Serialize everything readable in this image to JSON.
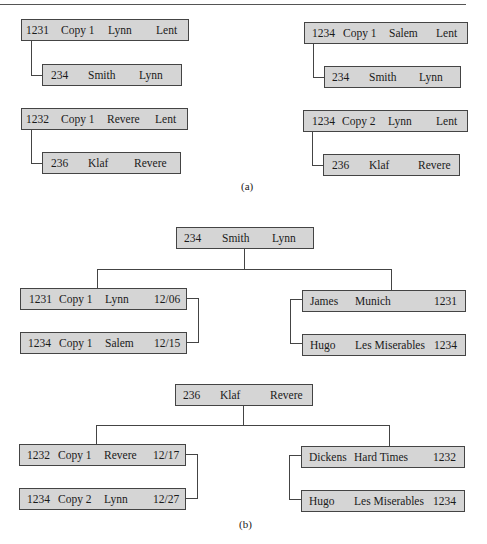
{
  "figure": {
    "part_a": {
      "caption": "(a)",
      "groups": [
        {
          "parent": [
            "1231",
            "Copy 1",
            "Lynn",
            "Lent"
          ],
          "child": [
            "234",
            "Smith",
            "Lynn"
          ]
        },
        {
          "parent": [
            "1232",
            "Copy 1",
            "Revere",
            "Lent"
          ],
          "child": [
            "236",
            "Klaf",
            "Revere"
          ]
        },
        {
          "parent": [
            "1234",
            "Copy 1",
            "Salem",
            "Lent"
          ],
          "child": [
            "234",
            "Smith",
            "Lynn"
          ]
        },
        {
          "parent": [
            "1234",
            "Copy 2",
            "Lynn",
            "Lent"
          ],
          "child": [
            "236",
            "Klaf",
            "Revere"
          ]
        }
      ]
    },
    "part_b": {
      "caption": "(b)",
      "trees": [
        {
          "root": [
            "234",
            "Smith",
            "Lynn"
          ],
          "left": [
            [
              "1231",
              "Copy 1",
              "Lynn",
              "12/06"
            ],
            [
              "1234",
              "Copy 1",
              "Salem",
              "12/15"
            ]
          ],
          "right": [
            [
              "James",
              "Munich",
              "1231"
            ],
            [
              "Hugo",
              "Les Miserables",
              "1234"
            ]
          ]
        },
        {
          "root": [
            "236",
            "Klaf",
            "Revere"
          ],
          "left": [
            [
              "1232",
              "Copy 1",
              "Revere",
              "12/17"
            ],
            [
              "1234",
              "Copy 2",
              "Lynn",
              "12/27"
            ]
          ],
          "right": [
            [
              "Dickens",
              "Hard Times",
              "1232"
            ],
            [
              "Hugo",
              "Les Miserables",
              "1234"
            ]
          ]
        }
      ]
    }
  }
}
